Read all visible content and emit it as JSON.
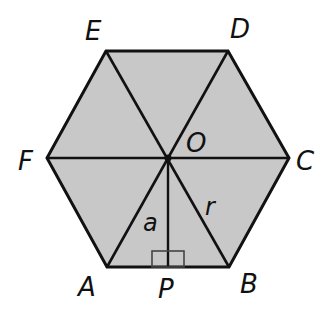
{
  "diagram": {
    "type": "regular-hexagon",
    "fill_color": "#c8c8c8",
    "stroke_color": "#111111",
    "vertices": [
      {
        "label": "A",
        "x": 107,
        "y": 267
      },
      {
        "label": "B",
        "x": 229,
        "y": 267
      },
      {
        "label": "C",
        "x": 289,
        "y": 158
      },
      {
        "label": "D",
        "x": 228,
        "y": 51
      },
      {
        "label": "E",
        "x": 106,
        "y": 51
      },
      {
        "label": "F",
        "x": 47,
        "y": 158
      }
    ],
    "center": {
      "label": "O",
      "x": 168,
      "y": 158
    },
    "foot": {
      "label": "P",
      "x": 168,
      "y": 267
    },
    "segments": {
      "apothem": "a",
      "radius": "r"
    },
    "right_angle_marker": true
  },
  "labels": {
    "A": "A",
    "B": "B",
    "C": "C",
    "D": "D",
    "E": "E",
    "F": "F",
    "O": "O",
    "P": "P",
    "a": "a",
    "r": "r"
  }
}
